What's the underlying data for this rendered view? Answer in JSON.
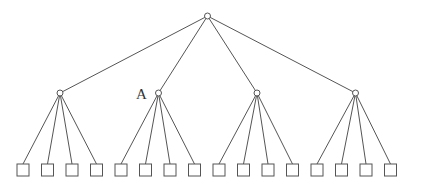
{
  "diagram": {
    "type": "tree",
    "root": {
      "x": 207.5,
      "y": 16,
      "r": 3
    },
    "level1": [
      {
        "x": 60,
        "y": 93,
        "r": 3
      },
      {
        "x": 158.5,
        "y": 93,
        "r": 3,
        "label": "A"
      },
      {
        "x": 257,
        "y": 93,
        "r": 3
      },
      {
        "x": 355.5,
        "y": 93,
        "r": 3
      }
    ],
    "leaf_size": 12,
    "leaf_top": 164,
    "leaf_lefts": [
      17,
      41.5,
      66,
      90.5,
      115,
      139.5,
      164,
      188.5,
      213,
      237.5,
      262,
      286.5,
      311,
      335.5,
      360,
      384.5
    ],
    "label_A": {
      "text": "A",
      "x": 136,
      "y": 99
    }
  }
}
